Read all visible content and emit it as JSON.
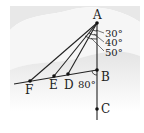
{
  "diagram": {
    "type": "geometry",
    "background": {
      "band_color": "#e6e6e6",
      "light_color": "#f7f7f7"
    },
    "points": {
      "A": {
        "label": "A",
        "x": 97,
        "y": 23
      },
      "B": {
        "label": "B",
        "x": 97,
        "y": 70
      },
      "C": {
        "label": "C",
        "x": 97,
        "y": 109
      },
      "D": {
        "label": "D",
        "x": 68,
        "y": 74
      },
      "E": {
        "label": "E",
        "x": 54,
        "y": 76
      },
      "F": {
        "label": "F",
        "x": 30,
        "y": 81
      }
    },
    "segments": [
      {
        "from": "A",
        "to": "C",
        "note": "vertical line through A, B, C"
      },
      {
        "from": "B",
        "to": "F",
        "note": "line through B, D, E, F extended left"
      },
      {
        "from": "A",
        "to": "D"
      },
      {
        "from": "A",
        "to": "E"
      },
      {
        "from": "A",
        "to": "F"
      }
    ],
    "angles": {
      "a1": {
        "label": "30°",
        "at": "A",
        "between": [
          "AB",
          "AD"
        ]
      },
      "a2": {
        "label": "40°",
        "at": "A",
        "between": [
          "AB",
          "AE"
        ]
      },
      "a3": {
        "label": "50°",
        "at": "A",
        "between": [
          "AB",
          "AF"
        ]
      },
      "b1": {
        "label": "80°",
        "at": "B",
        "between": [
          "BA",
          "BD"
        ]
      }
    },
    "line_color": "#222222"
  }
}
